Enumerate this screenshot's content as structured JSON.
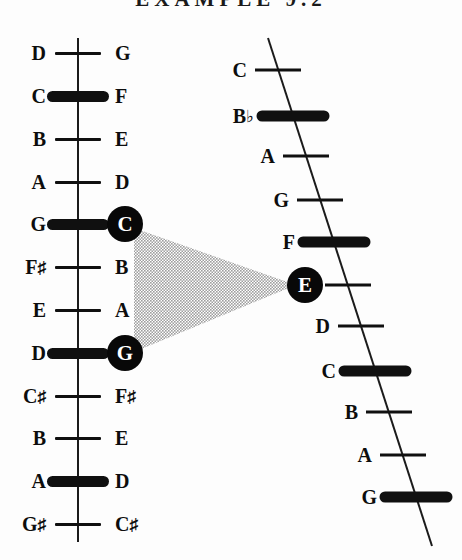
{
  "figure": {
    "title": "EXAMPLE 9.2",
    "ink_color": "#101010",
    "beam_color": "#b4b4b4",
    "paper_color": "#fdfdfd"
  },
  "left_string": {
    "name": "vertical-string",
    "orientation": "vertical",
    "x": 78,
    "top_y": 38,
    "bottom_y": 542,
    "fret_spacing": 43,
    "first_fret_y": 53,
    "frets": [
      {
        "index": 0,
        "y": 53,
        "left_label": "D",
        "right_label": "G",
        "accent": false,
        "circled": null
      },
      {
        "index": 1,
        "y": 96,
        "left_label": "C",
        "right_label": "F",
        "accent": true,
        "circled": null
      },
      {
        "index": 2,
        "y": 139,
        "left_label": "B",
        "right_label": "E",
        "accent": false,
        "circled": null
      },
      {
        "index": 3,
        "y": 182,
        "left_label": "A",
        "right_label": "D",
        "accent": false,
        "circled": null
      },
      {
        "index": 4,
        "y": 224,
        "left_label": "G",
        "right_label": "C",
        "accent": true,
        "circled": "C"
      },
      {
        "index": 5,
        "y": 267,
        "left_label": "F♯",
        "right_label": "B",
        "accent": false,
        "circled": null
      },
      {
        "index": 6,
        "y": 310,
        "left_label": "E",
        "right_label": "A",
        "accent": false,
        "circled": null
      },
      {
        "index": 7,
        "y": 353,
        "left_label": "D",
        "right_label": "G",
        "accent": true,
        "circled": "G"
      },
      {
        "index": 8,
        "y": 396,
        "left_label": "C♯",
        "right_label": "F♯",
        "accent": false,
        "circled": null
      },
      {
        "index": 9,
        "y": 438,
        "left_label": "B",
        "right_label": "E",
        "accent": false,
        "circled": null
      },
      {
        "index": 10,
        "y": 481,
        "left_label": "A",
        "right_label": "D",
        "accent": true,
        "circled": null
      },
      {
        "index": 11,
        "y": 524,
        "left_label": "G♯",
        "right_label": "C♯",
        "accent": false,
        "circled": null
      }
    ]
  },
  "right_string": {
    "name": "slanted-string",
    "orientation": "slanted",
    "top_point": {
      "x": 268,
      "y": 38
    },
    "bottom_point": {
      "x": 432,
      "y": 546
    },
    "frets": [
      {
        "index": 0,
        "y": 70,
        "line_x": 278,
        "label": "C",
        "accent": false,
        "circled": false
      },
      {
        "index": 1,
        "y": 116,
        "line_x": 293,
        "label": "B♭",
        "accent": true,
        "circled": false
      },
      {
        "index": 2,
        "y": 156,
        "line_x": 306,
        "label": "A",
        "accent": false,
        "circled": false
      },
      {
        "index": 3,
        "y": 200,
        "line_x": 320,
        "label": "G",
        "accent": false,
        "circled": false
      },
      {
        "index": 4,
        "y": 242,
        "line_x": 334,
        "label": "F",
        "accent": true,
        "circled": false
      },
      {
        "index": 5,
        "y": 285,
        "line_x": 348,
        "label": "E",
        "accent": false,
        "circled": true
      },
      {
        "index": 6,
        "y": 326,
        "line_x": 361,
        "label": "D",
        "accent": false,
        "circled": false
      },
      {
        "index": 7,
        "y": 371,
        "line_x": 375,
        "label": "C",
        "accent": true,
        "circled": false
      },
      {
        "index": 8,
        "y": 412,
        "line_x": 389,
        "label": "B",
        "accent": false,
        "circled": false
      },
      {
        "index": 9,
        "y": 455,
        "line_x": 403,
        "label": "A",
        "accent": false,
        "circled": false
      },
      {
        "index": 10,
        "y": 497,
        "line_x": 416,
        "label": "G",
        "accent": true,
        "circled": false
      }
    ]
  },
  "circled_notes": [
    {
      "id": "left-c",
      "label": "C",
      "x": 125,
      "y": 224,
      "string": "left"
    },
    {
      "id": "left-g",
      "label": "G",
      "x": 125,
      "y": 353,
      "string": "left"
    },
    {
      "id": "right-e",
      "label": "E",
      "x": 305,
      "y": 285,
      "string": "right"
    }
  ],
  "beam": {
    "name": "convergence-beam",
    "from_notes": [
      "C",
      "G"
    ],
    "to_note": "E",
    "apex": {
      "x": 296,
      "y": 285
    },
    "base_top": {
      "x": 134,
      "y": 228
    },
    "base_bottom": {
      "x": 134,
      "y": 352
    }
  }
}
